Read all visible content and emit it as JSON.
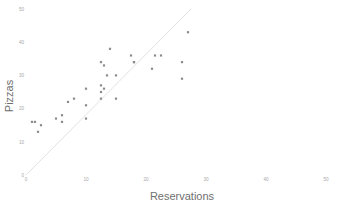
{
  "chart_data": {
    "type": "scatter",
    "title": "",
    "xlabel": "Reservations",
    "ylabel": "Pizzas",
    "xlim": [
      0,
      50
    ],
    "ylim": [
      0,
      50
    ],
    "xticks": [
      0,
      10,
      20,
      30,
      40,
      50
    ],
    "yticks": [
      0,
      10,
      20,
      30,
      40,
      50
    ],
    "xtick_labels": [
      "0",
      "10",
      "20",
      "30",
      "40",
      "50"
    ],
    "ytick_labels": [
      "0",
      "10",
      "20",
      "30",
      "40",
      "50"
    ],
    "grid": false,
    "legend": null,
    "point_color": "#8c8c8c",
    "line_color": "#e2e2e2",
    "background_color": "#ffffff",
    "series": [
      {
        "name": "observations",
        "marker": "square",
        "x": [
          1,
          1.5,
          2,
          2.5,
          5,
          6,
          6,
          7,
          8,
          10,
          10,
          10,
          12.5,
          12.5,
          12.5,
          12.5,
          13,
          13,
          13.5,
          14,
          15,
          15,
          17.5,
          18,
          18,
          21,
          21.5,
          22.5,
          26,
          26,
          27
        ],
        "y": [
          16,
          16,
          13,
          15,
          17,
          18,
          16,
          22,
          23,
          26,
          21,
          17,
          34,
          27,
          25,
          23,
          33,
          26,
          30,
          38,
          30,
          23,
          36,
          34,
          34,
          32,
          36,
          36,
          34,
          29,
          43
        ]
      }
    ],
    "fit_line": {
      "name": "fit",
      "x": [
        0,
        27.5
      ],
      "y": [
        0,
        50
      ]
    }
  },
  "axis_titles": {
    "x": "Reservations",
    "y": "Pizzas"
  }
}
